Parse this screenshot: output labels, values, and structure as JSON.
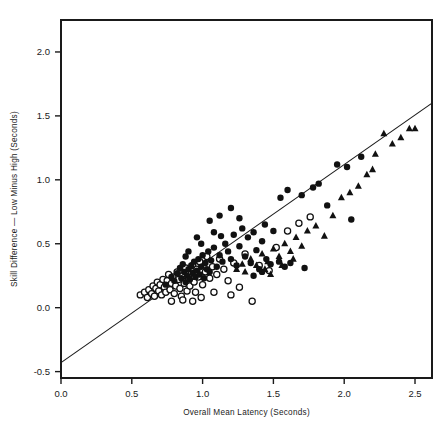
{
  "chart_data": {
    "type": "scatter",
    "title": "",
    "subtitle": "",
    "xlabel": "Overall Mean Latency (Seconds)",
    "ylabel": "Skill Difference — Low Minus High (Seconds)",
    "xlim": [
      0.0,
      2.62
    ],
    "ylim": [
      -0.55,
      2.25
    ],
    "xticks": [
      0.0,
      0.5,
      1.0,
      1.5,
      2.0,
      2.5
    ],
    "xticklabels": [
      "0.0",
      "0.5",
      "1.0",
      "1.5",
      "2.0",
      "2.5"
    ],
    "yticks": [
      -0.5,
      0.0,
      0.5,
      1.0,
      1.5,
      2.0
    ],
    "yticklabels": [
      "-0.5",
      "0.0",
      "0.5",
      "1.0",
      "1.5",
      "2.0"
    ],
    "grid": false,
    "legend_position": "none",
    "frame": "box",
    "marker_color": "#111111",
    "line_color": "#1a1a1a",
    "regression_line": {
      "label": "fitted regression line",
      "x_start": 0.0,
      "y_start": -0.43,
      "x_end": 2.62,
      "y_end": 1.6,
      "slope": 0.775,
      "intercept": -0.43
    },
    "series": [
      {
        "name": "Open circles",
        "marker": "open-circle",
        "points": [
          [
            0.56,
            0.1
          ],
          [
            0.59,
            0.12
          ],
          [
            0.61,
            0.08
          ],
          [
            0.62,
            0.14
          ],
          [
            0.64,
            0.11
          ],
          [
            0.65,
            0.17
          ],
          [
            0.66,
            0.09
          ],
          [
            0.67,
            0.15
          ],
          [
            0.68,
            0.2
          ],
          [
            0.69,
            0.13
          ],
          [
            0.7,
            0.18
          ],
          [
            0.71,
            0.1
          ],
          [
            0.72,
            0.22
          ],
          [
            0.73,
            0.16
          ],
          [
            0.74,
            0.12
          ],
          [
            0.75,
            0.21
          ],
          [
            0.76,
            0.26
          ],
          [
            0.77,
            0.14
          ],
          [
            0.78,
            0.19
          ],
          [
            0.79,
            0.24
          ],
          [
            0.8,
            0.11
          ],
          [
            0.81,
            0.17
          ],
          [
            0.82,
            0.28
          ],
          [
            0.83,
            0.22
          ],
          [
            0.84,
            0.15
          ],
          [
            0.85,
            0.09
          ],
          [
            0.86,
            0.25
          ],
          [
            0.87,
            0.19
          ],
          [
            0.88,
            0.31
          ],
          [
            0.89,
            0.13
          ],
          [
            0.9,
            0.23
          ],
          [
            0.91,
            0.17
          ],
          [
            0.92,
            0.27
          ],
          [
            0.93,
            0.33
          ],
          [
            0.94,
            0.2
          ],
          [
            0.95,
            0.12
          ],
          [
            0.96,
            0.3
          ],
          [
            0.97,
            0.24
          ],
          [
            0.98,
            0.36
          ],
          [
            1.0,
            0.18
          ],
          [
            1.02,
            0.28
          ],
          [
            1.03,
            0.4
          ],
          [
            1.05,
            0.23
          ],
          [
            1.07,
            0.32
          ],
          [
            1.1,
            0.26
          ],
          [
            1.12,
            0.38
          ],
          [
            1.15,
            0.3
          ],
          [
            1.18,
            0.21
          ],
          [
            1.22,
            0.35
          ],
          [
            1.26,
            0.16
          ],
          [
            1.3,
            0.42
          ],
          [
            1.35,
            0.05
          ],
          [
            1.4,
            0.33
          ],
          [
            1.47,
            0.29
          ],
          [
            1.52,
            0.47
          ],
          [
            1.6,
            0.6
          ],
          [
            1.68,
            0.66
          ],
          [
            1.76,
            0.71
          ],
          [
            0.86,
            0.06
          ],
          [
            0.93,
            0.05
          ],
          [
            0.99,
            0.08
          ],
          [
            0.78,
            0.05
          ],
          [
            1.08,
            0.12
          ],
          [
            1.2,
            0.1
          ]
        ]
      },
      {
        "name": "Filled circles",
        "marker": "filled-circle",
        "points": [
          [
            0.74,
            0.18
          ],
          [
            0.78,
            0.24
          ],
          [
            0.8,
            0.21
          ],
          [
            0.82,
            0.27
          ],
          [
            0.84,
            0.31
          ],
          [
            0.85,
            0.23
          ],
          [
            0.86,
            0.34
          ],
          [
            0.87,
            0.28
          ],
          [
            0.88,
            0.2
          ],
          [
            0.89,
            0.25
          ],
          [
            0.9,
            0.3
          ],
          [
            0.91,
            0.22
          ],
          [
            0.92,
            0.33
          ],
          [
            0.93,
            0.27
          ],
          [
            0.94,
            0.36
          ],
          [
            0.95,
            0.24
          ],
          [
            0.96,
            0.29
          ],
          [
            0.97,
            0.38
          ],
          [
            0.98,
            0.26
          ],
          [
            0.99,
            0.32
          ],
          [
            1.0,
            0.41
          ],
          [
            1.01,
            0.23
          ],
          [
            1.02,
            0.35
          ],
          [
            1.03,
            0.3
          ],
          [
            1.04,
            0.44
          ],
          [
            1.05,
            0.28
          ],
          [
            1.06,
            0.37
          ],
          [
            1.08,
            0.47
          ],
          [
            1.1,
            0.32
          ],
          [
            1.12,
            0.41
          ],
          [
            1.13,
            0.56
          ],
          [
            1.14,
            0.36
          ],
          [
            1.16,
            0.5
          ],
          [
            1.18,
            0.44
          ],
          [
            1.2,
            0.38
          ],
          [
            1.22,
            0.57
          ],
          [
            1.24,
            0.33
          ],
          [
            1.26,
            0.48
          ],
          [
            1.28,
            0.62
          ],
          [
            1.3,
            0.4
          ],
          [
            1.32,
            0.55
          ],
          [
            1.34,
            0.35
          ],
          [
            1.36,
            0.59
          ],
          [
            1.38,
            0.45
          ],
          [
            1.4,
            0.3
          ],
          [
            1.42,
            0.52
          ],
          [
            1.45,
            0.38
          ],
          [
            1.48,
            0.34
          ],
          [
            1.5,
            0.6
          ],
          [
            1.54,
            0.36
          ],
          [
            1.58,
            0.32
          ],
          [
            1.62,
            0.35
          ],
          [
            1.7,
            0.88
          ],
          [
            1.72,
            0.31
          ],
          [
            1.78,
            0.94
          ],
          [
            1.82,
            0.97
          ],
          [
            1.88,
            0.8
          ],
          [
            1.95,
            1.12
          ],
          [
            2.02,
            1.1
          ],
          [
            2.05,
            0.69
          ],
          [
            2.12,
            1.18
          ],
          [
            1.05,
            0.68
          ],
          [
            1.12,
            0.72
          ],
          [
            1.2,
            0.78
          ],
          [
            1.26,
            0.7
          ],
          [
            0.96,
            0.55
          ],
          [
            0.99,
            0.5
          ],
          [
            1.08,
            0.59
          ],
          [
            1.44,
            0.65
          ],
          [
            1.55,
            0.86
          ],
          [
            1.6,
            0.92
          ],
          [
            0.9,
            0.44
          ],
          [
            0.88,
            0.4
          ],
          [
            1.36,
            0.25
          ],
          [
            1.42,
            0.28
          ]
        ]
      },
      {
        "name": "Filled triangles",
        "marker": "filled-triangle",
        "points": [
          [
            1.24,
            0.3
          ],
          [
            1.28,
            0.34
          ],
          [
            1.3,
            0.28
          ],
          [
            1.34,
            0.38
          ],
          [
            1.38,
            0.33
          ],
          [
            1.42,
            0.42
          ],
          [
            1.46,
            0.36
          ],
          [
            1.5,
            0.46
          ],
          [
            1.54,
            0.4
          ],
          [
            1.58,
            0.5
          ],
          [
            1.62,
            0.44
          ],
          [
            1.66,
            0.55
          ],
          [
            1.7,
            0.48
          ],
          [
            1.74,
            0.6
          ],
          [
            1.8,
            0.64
          ],
          [
            1.86,
            0.56
          ],
          [
            1.92,
            0.72
          ],
          [
            1.98,
            0.86
          ],
          [
            2.04,
            0.9
          ],
          [
            2.1,
            0.95
          ],
          [
            2.16,
            1.04
          ],
          [
            2.22,
            1.2
          ],
          [
            2.28,
            1.36
          ],
          [
            2.34,
            1.28
          ],
          [
            2.4,
            1.33
          ],
          [
            2.46,
            1.4
          ],
          [
            2.5,
            1.4
          ],
          [
            2.2,
            1.08
          ],
          [
            1.44,
            0.3
          ],
          [
            1.48,
            0.26
          ],
          [
            1.56,
            0.33
          ],
          [
            1.64,
            0.38
          ]
        ]
      }
    ]
  }
}
